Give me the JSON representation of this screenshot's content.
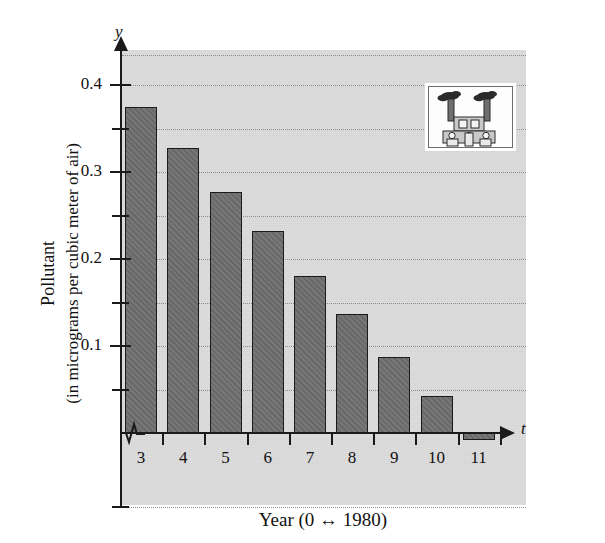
{
  "figure": {
    "kind": "textbook-bar-chart",
    "background_color": "#ffffff",
    "plot_background_color": "#d8d8d8",
    "bar_fill_color": "#6e6e6e",
    "bar_outline_color": "#1b1b1b",
    "gridline_color": "#8b8b8b",
    "axis_color": "#1a1a1a"
  },
  "axis_names": {
    "y": "y",
    "t": "t"
  },
  "inset": {
    "name": "factory-illustration",
    "description": "factory with two smokestacks emitting smoke",
    "border_color": "#6d6d6d",
    "background_color": "#fdfdfd",
    "smoke_color": "#2b2b2b",
    "building_color": "#c9c9c9"
  },
  "chart_data": {
    "type": "bar",
    "title": "",
    "xlabel": "Year (0 ↔ 1980)",
    "ylabel_line1": "Pollutant",
    "ylabel_line2": "(in micrograms per cubic meter of air)",
    "categories": [
      "3",
      "4",
      "5",
      "6",
      "7",
      "8",
      "9",
      "10",
      "11"
    ],
    "values": [
      0.375,
      0.328,
      0.277,
      0.232,
      0.181,
      0.137,
      0.087,
      0.043,
      0.004
    ],
    "x": [
      3,
      4,
      5,
      6,
      7,
      8,
      9,
      10,
      11
    ],
    "xlim": [
      2.4,
      11.8
    ],
    "ylim": [
      0.0,
      0.435
    ],
    "y_major_ticks": [
      0.1,
      0.2,
      0.3,
      0.4
    ],
    "y_major_tick_labels": [
      "0.1",
      "0.2",
      "0.3",
      "0.4"
    ],
    "y_minor_ticks": [
      0.05,
      0.15,
      0.25,
      0.35
    ],
    "y_extra_gridlines": [
      0.435,
      -0.085
    ],
    "x_tick_positions": [
      2.5,
      3.5,
      4.5,
      5.5,
      6.5,
      7.5,
      8.5,
      9.5,
      10.5,
      11.5
    ],
    "grid": "dotted-horizontal",
    "legend": "none",
    "axis_break": "y-axis break zigzag near origin"
  },
  "tick_labels": {
    "y": [
      "0.4",
      "0.3",
      "0.2",
      "0.1"
    ],
    "x": [
      "3",
      "4",
      "5",
      "6",
      "7",
      "8",
      "9",
      "10",
      "11"
    ]
  }
}
